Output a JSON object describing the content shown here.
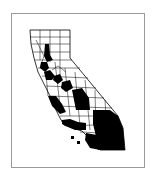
{
  "map": {
    "subject": "California counties",
    "legend": "",
    "fill_color": "#000000",
    "line_color": "#000000",
    "background_color": "#ffffff",
    "frame_color": "#9a9a9a",
    "highlighted_regions": [
      "Butte",
      "Yuba",
      "Sacramento",
      "Stanislaus",
      "Merced",
      "Fresno",
      "Tulare",
      "Kern",
      "Monterey",
      "San Luis Obispo",
      "Ventura",
      "Los Angeles",
      "San Bernardino",
      "Riverside",
      "San Diego"
    ]
  }
}
